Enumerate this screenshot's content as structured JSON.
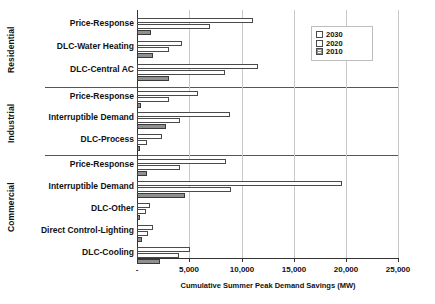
{
  "chart_data": {
    "type": "bar",
    "orientation": "horizontal",
    "title": "",
    "xlabel": "Cumulative Summer Peak Demand Savings (MW)",
    "ylabel": "",
    "xlim": [
      0,
      25000
    ],
    "xticks": [
      "-",
      "5,000",
      "10,000",
      "15,000",
      "20,000",
      "25,000"
    ],
    "xtick_values": [
      0,
      5000,
      10000,
      15000,
      20000,
      25000
    ],
    "grid": true,
    "legend_position": "top-right",
    "legend": [
      "2030",
      "2020",
      "2010"
    ],
    "groups": [
      {
        "name": "Residential",
        "categories": [
          "Price-Response",
          "DLC-Water Heating",
          "DLC-Central AC"
        ]
      },
      {
        "name": "Industrial",
        "categories": [
          "Price-Response",
          "Interruptible Demand",
          "DLC-Process"
        ]
      },
      {
        "name": "Commercial",
        "categories": [
          "Price-Response",
          "Interruptible Demand",
          "DLC-Other",
          "Direct Control-Lighting",
          "DLC-Cooling"
        ]
      }
    ],
    "categories": [
      "Price-Response",
      "DLC-Water Heating",
      "DLC-Central AC",
      "Price-Response",
      "Interruptible Demand",
      "DLC-Process",
      "Price-Response",
      "Interruptible Demand",
      "DLC-Other",
      "Direct Control-Lighting",
      "DLC-Cooling"
    ],
    "series": [
      {
        "name": "2030",
        "values": [
          11050,
          4300,
          11500,
          5800,
          8900,
          2400,
          8500,
          19600,
          1250,
          1550,
          5100
        ]
      },
      {
        "name": "2020",
        "values": [
          7000,
          3100,
          8400,
          3100,
          4150,
          950,
          4150,
          9000,
          900,
          1050,
          4000
        ]
      },
      {
        "name": "2010",
        "values": [
          1350,
          1550,
          3100,
          400,
          2800,
          270,
          950,
          4600,
          320,
          480,
          2200
        ]
      }
    ]
  }
}
